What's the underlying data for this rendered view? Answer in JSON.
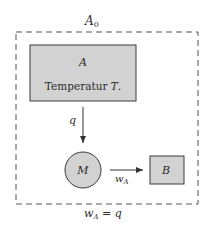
{
  "diagram": {
    "outer_label_main": "A",
    "outer_label_sub": "0",
    "box_a": {
      "label": "A",
      "text": "Temperatur",
      "text_var": "T",
      "text_tail": "."
    },
    "flow_q": {
      "label": "q"
    },
    "machine": {
      "label": "M"
    },
    "work_arrow": {
      "label_main": "w",
      "label_sub": "A"
    },
    "box_b": {
      "label": "B"
    },
    "equation": {
      "lhs_main": "w",
      "lhs_sub": "A",
      "op": " = ",
      "rhs": "q"
    },
    "colors": {
      "fill": "#d2d2d2",
      "stroke": "#3a3a3a",
      "dash": "#555555"
    }
  }
}
